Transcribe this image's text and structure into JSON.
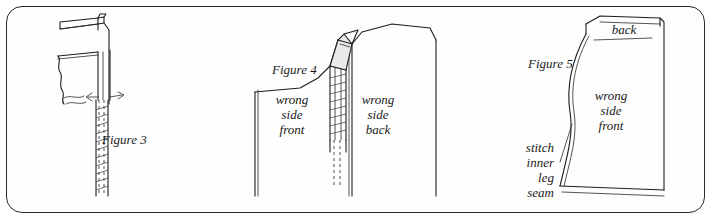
{
  "page": {
    "background_color": "#ffffff",
    "border_color": "#2b2b2b",
    "ink_color": "#1d1d1d"
  },
  "figures": [
    {
      "id": "figure-3",
      "caption": "Figure 3",
      "labels": []
    },
    {
      "id": "figure-4",
      "caption": "Figure 4",
      "labels": [
        {
          "id": "wrong-side-front",
          "lines": [
            "wrong",
            "side",
            "front"
          ]
        },
        {
          "id": "wrong-side-back",
          "lines": [
            "wrong",
            "side",
            "back"
          ]
        }
      ]
    },
    {
      "id": "figure-5",
      "caption": "Figure 5",
      "labels": [
        {
          "id": "back",
          "lines": [
            "back"
          ]
        },
        {
          "id": "wrong-side-front",
          "lines": [
            "wrong",
            "side",
            "front"
          ]
        },
        {
          "id": "stitch-inner-leg-seam",
          "lines": [
            "stitch",
            "inner",
            "leg",
            "seam"
          ]
        }
      ]
    }
  ],
  "text": {
    "figure3_caption": "Figure 3",
    "figure4_caption": "Figure 4",
    "figure5_caption": "Figure 5",
    "f4_wrong": "wrong",
    "f4_side": "side",
    "f4_front": "front",
    "f4_wrong2": "wrong",
    "f4_side2": "side",
    "f4_back": "back",
    "f5_back": "back",
    "f5_wrong": "wrong",
    "f5_side": "side",
    "f5_front": "front",
    "f5_stitch": "stitch",
    "f5_inner": "inner",
    "f5_leg": "leg",
    "f5_seam": "seam"
  }
}
